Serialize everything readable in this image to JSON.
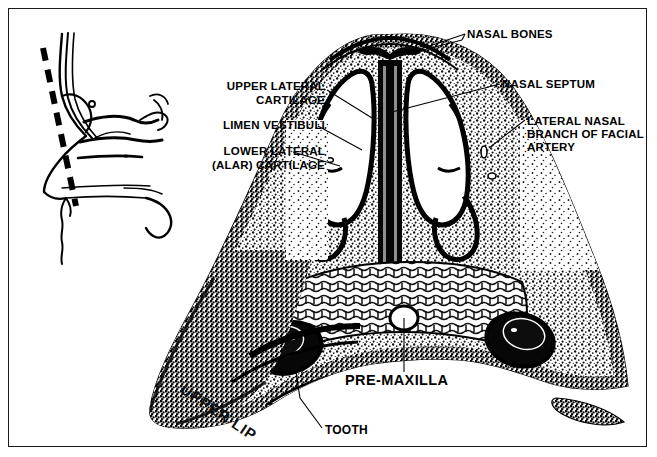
{
  "figure": {
    "border_color": "#1a1a1a",
    "background": "#ffffff",
    "ink_color": "#000000"
  },
  "inset": {
    "name": "sagittal-nose-profile",
    "description": "Lateral (sagittal) outline of the nose and nasal cavity with a thick dashed line marking the plane of the coronal section",
    "section_line_style": "dashed",
    "section_line_color": "#000000"
  },
  "specimen": {
    "name": "coronal-histologic-section",
    "description": "High-contrast halftone photomicrograph of a coronal section through the nose showing paired nasal vestibules, central nasal septum, alar cartilages, pre-maxilla with tooth buds and the upper lip"
  },
  "labels": [
    {
      "id": "upper-lateral-cartilage",
      "text": "UPPER LATERAL\nCARTILAGE",
      "align": "right"
    },
    {
      "id": "limen-vestibuli",
      "text": "LIMEN VESTIBULI",
      "align": "right"
    },
    {
      "id": "lower-lateral-cartilage",
      "text": "LOWER LATERAL\n(ALAR) CARTILAGE",
      "align": "right"
    },
    {
      "id": "nasal-bones",
      "text": "NASAL BONES",
      "align": "left"
    },
    {
      "id": "nasal-septum",
      "text": "NASAL SEPTUM",
      "align": "left"
    },
    {
      "id": "lateral-nasal-artery",
      "text": "LATERAL NASAL\nBRANCH OF FACIAL\nARTERY",
      "align": "left"
    },
    {
      "id": "pre-maxilla",
      "text": "PRE-MAXILLA",
      "align": "left"
    },
    {
      "id": "tooth",
      "text": "TOOTH",
      "align": "left"
    },
    {
      "id": "upper-lip",
      "text": "UPPER LIP",
      "align": "left",
      "rotated": true
    }
  ]
}
